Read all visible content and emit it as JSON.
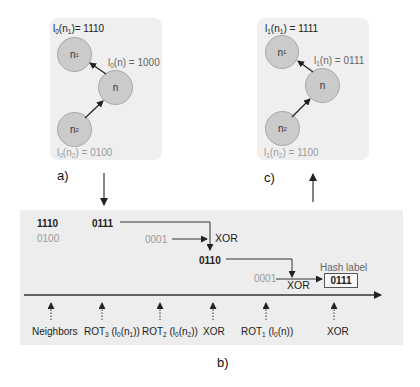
{
  "panel_a": {
    "caption": "a)",
    "nodes": [
      {
        "id": "n1",
        "base": "n",
        "sub": "1"
      },
      {
        "id": "n",
        "base": "n",
        "sub": ""
      },
      {
        "id": "n2",
        "base": "n",
        "sub": "2"
      }
    ],
    "labels": {
      "n1": {
        "fn": "l",
        "fn_sub": "0",
        "arg": "n",
        "arg_sub": "1",
        "value": "1110",
        "text": "l0(n1)= 1110"
      },
      "n": {
        "fn": "l",
        "fn_sub": "0",
        "arg": "n",
        "arg_sub": "",
        "value": "1000",
        "text": "l0(n) = 1000"
      },
      "n2": {
        "fn": "l",
        "fn_sub": "0",
        "arg": "n",
        "arg_sub": "2",
        "value": "0100",
        "text": "l0(n2) = 0100"
      }
    },
    "edges": [
      {
        "from": "n2",
        "to": "n"
      },
      {
        "from": "n",
        "to": "n1"
      }
    ]
  },
  "panel_c": {
    "caption": "c)",
    "nodes": [
      {
        "id": "n1",
        "base": "n",
        "sub": "1"
      },
      {
        "id": "n",
        "base": "n",
        "sub": ""
      },
      {
        "id": "n2",
        "base": "n",
        "sub": "2"
      }
    ],
    "labels": {
      "n1": {
        "fn": "l",
        "fn_sub": "1",
        "arg": "n",
        "arg_sub": "1",
        "value": "1111",
        "text": "l1(n1) = 1111"
      },
      "n": {
        "fn": "l",
        "fn_sub": "1",
        "arg": "n",
        "arg_sub": "",
        "value": "0111",
        "text": "l1(n) = 0111"
      },
      "n2": {
        "fn": "l",
        "fn_sub": "1",
        "arg": "n",
        "arg_sub": "2",
        "value": "1100",
        "text": "l1(n2) = 1100"
      }
    },
    "edges": [
      {
        "from": "n2",
        "to": "n"
      },
      {
        "from": "n",
        "to": "n1"
      }
    ]
  },
  "panel_b": {
    "caption": "b)",
    "values": {
      "neighbor_1": "1110",
      "neighbor_2": "0100",
      "rot3": "0111",
      "rot2": "0001",
      "xor1_result": "0110",
      "rot1": "0001",
      "hash_value": "0111"
    },
    "xor_label": "XOR",
    "hash_label_title": "Hash label",
    "timeline_steps": [
      {
        "label": "Neighbors"
      },
      {
        "label": "ROT3 (l0(n1))",
        "rot": "ROT",
        "rot_sub": "3",
        "fn": "l",
        "fn_sub": "0",
        "arg": "n",
        "arg_sub": "1"
      },
      {
        "label": "ROT2 (l0(n2))",
        "rot": "ROT",
        "rot_sub": "2",
        "fn": "l",
        "fn_sub": "0",
        "arg": "n",
        "arg_sub": "2"
      },
      {
        "label": "XOR"
      },
      {
        "label": "ROT1 (l0(n))",
        "rot": "ROT",
        "rot_sub": "1",
        "fn": "l",
        "fn_sub": "0",
        "arg": "n",
        "arg_sub": ""
      },
      {
        "label": "XOR"
      }
    ]
  },
  "colors": {
    "panel_bg": "#efefef",
    "node_fill": "#cbcbcb",
    "node_stroke": "#a8a8a8",
    "arrow": "#222222",
    "faded_text": "#9a9a9a"
  }
}
